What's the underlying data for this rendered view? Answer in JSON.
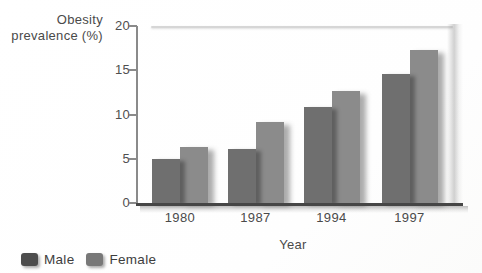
{
  "figure": {
    "y_axis_title_line1": "Obesity",
    "y_axis_title_line2": "prevalence (%)",
    "x_axis_title": "Year"
  },
  "legend": {
    "items": [
      {
        "label": "Male"
      },
      {
        "label": "Female"
      }
    ]
  },
  "colors": {
    "male_bar": "#6f6f6f",
    "female_bar": "#8b8b8b",
    "male_swatch": "#4d4d4d",
    "female_swatch": "#787878",
    "axis": "#8a8a8a",
    "baseline": "#464646",
    "text": "#4a4a4a"
  },
  "chart_data": {
    "type": "bar",
    "categories": [
      "1980",
      "1987",
      "1994",
      "1997"
    ],
    "series": [
      {
        "name": "Male",
        "values": [
          5.0,
          6.1,
          10.8,
          14.6
        ]
      },
      {
        "name": "Female",
        "values": [
          6.3,
          9.1,
          12.6,
          17.3
        ]
      }
    ],
    "title": "",
    "xlabel": "Year",
    "ylabel": "Obesity prevalence (%)",
    "ylim": [
      0,
      20
    ],
    "yticks": [
      0,
      5,
      10,
      15,
      20
    ],
    "grid": false,
    "legend_position": "bottom-left"
  }
}
